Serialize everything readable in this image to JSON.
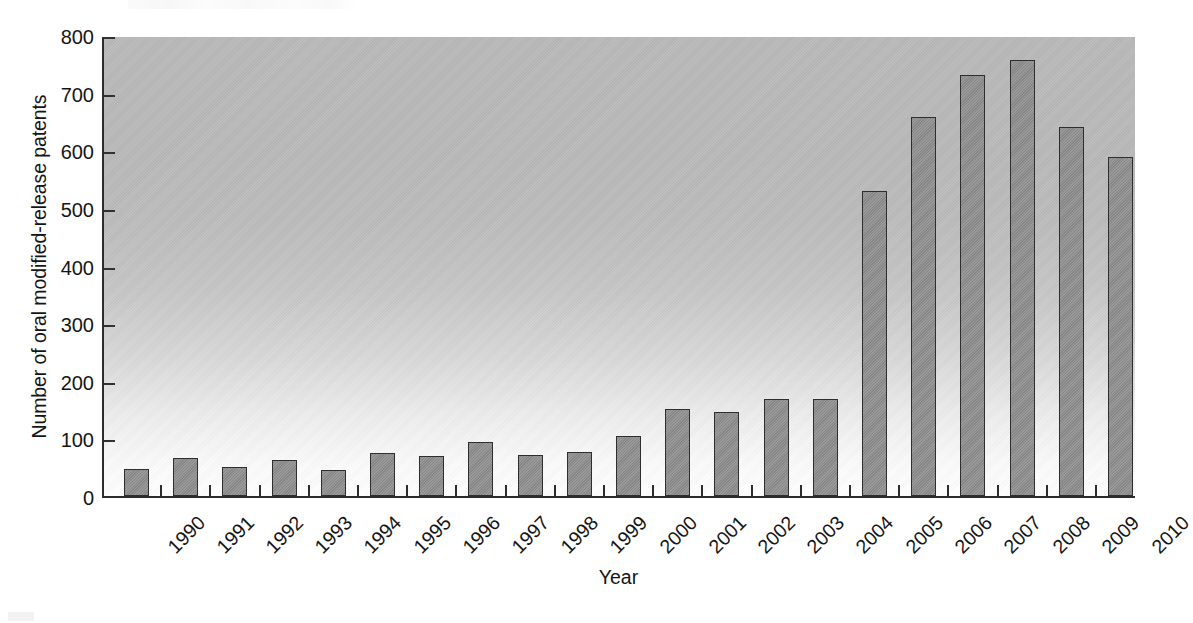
{
  "chart_data": {
    "type": "bar",
    "title": "",
    "xlabel": "Year",
    "ylabel": "Number of oral modified-release patents",
    "categories": [
      "1990",
      "1991",
      "1992",
      "1993",
      "1994",
      "1995",
      "1996",
      "1997",
      "1998",
      "1999",
      "2000",
      "2001",
      "2002",
      "2003",
      "2004",
      "2005",
      "2006",
      "2007",
      "2008",
      "2009",
      "2010"
    ],
    "values": [
      47,
      66,
      50,
      63,
      46,
      75,
      69,
      94,
      71,
      76,
      104,
      151,
      145,
      168,
      168,
      530,
      657,
      730,
      757,
      640,
      588
    ],
    "ylim": [
      0,
      800
    ],
    "ytick_values": [
      0,
      100,
      200,
      300,
      400,
      500,
      600,
      700,
      800
    ],
    "ytick_labels": [
      "0",
      "100",
      "200",
      "300",
      "400",
      "500",
      "600",
      "700",
      "800"
    ],
    "grid": false,
    "legend": false,
    "legend_position": "none",
    "bar_fill_color": "#8e8e8e",
    "bar_edge_color": "#2e2e2e",
    "axis_color": "#2c2c2c",
    "plot_background": "gradient-gray-to-white"
  }
}
